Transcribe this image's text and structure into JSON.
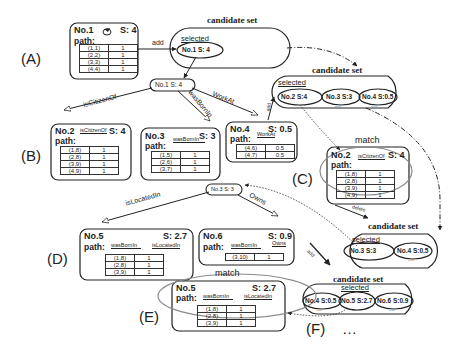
{
  "steps": {
    "A": "(A)",
    "B": "(B)",
    "C": "(C)",
    "D": "(D)",
    "E": "(E)",
    "F": "(F)",
    "ellipsis": "…"
  },
  "common": {
    "path": "path:",
    "candidate_set": "candidate set",
    "selected": "selected",
    "match": "match",
    "add": "add",
    "delete": "delete",
    "more": "..."
  },
  "nodes": {
    "n1": {
      "title": "No.1",
      "score": "S: 4",
      "rows": [
        [
          "(1,1)",
          "1"
        ],
        [
          "(2,2)",
          "1"
        ],
        [
          "(3,3)",
          "1"
        ],
        [
          "(4,4)",
          "1"
        ]
      ]
    },
    "n2": {
      "title": "No.2",
      "score": "S: 4",
      "relations": [
        "isCitizenOf"
      ],
      "rows": [
        [
          "(1,8)",
          "1"
        ],
        [
          "(2,8)",
          "1"
        ],
        [
          "(3,9)",
          "1"
        ],
        [
          "(4,9)",
          "1"
        ]
      ]
    },
    "n3": {
      "title": "No.3",
      "score": "S: 3",
      "relations": [
        "wasBornIn"
      ],
      "rows": [
        [
          "(1,5)",
          "1"
        ],
        [
          "(2,6)",
          "1"
        ],
        [
          "(3,7)",
          "1"
        ]
      ]
    },
    "n4": {
      "title": "No.4",
      "score": "S: 0.5",
      "relations": [
        "WorkAt"
      ],
      "rows": [
        [
          "(4,6)",
          "0.5"
        ],
        [
          "(4,7)",
          "0.5"
        ]
      ]
    },
    "n2c": {
      "title": "No.2",
      "score": "S: 4",
      "relations": [
        "isCitizenOf"
      ],
      "rows": [
        [
          "(1,8)",
          "1"
        ],
        [
          "(2,8)",
          "1"
        ],
        [
          "(3,9)",
          "1"
        ],
        [
          "(4,9)",
          "1"
        ]
      ]
    },
    "n5": {
      "title": "No.5",
      "score": "S: 2.7",
      "relations": [
        "wasBornIn",
        "isLocatedIn"
      ],
      "rows": [
        [
          "(1,8)",
          "1"
        ],
        [
          "(2,8)",
          "1"
        ],
        [
          "(3,9)",
          "1"
        ]
      ]
    },
    "n6": {
      "title": "No.6",
      "score": "S: 0.9",
      "relations": [
        "wasBornIn",
        "Owns"
      ],
      "rows": [
        [
          "(3,10)",
          "1"
        ]
      ]
    },
    "n5e": {
      "title": "No.5",
      "score": "S: 2.7",
      "relations": [
        "wasBornIn",
        "isLocatedIn"
      ],
      "rows": [
        [
          "(1,8)",
          "1"
        ],
        [
          "(2,8)",
          "1"
        ],
        [
          "(3,9)",
          "1"
        ]
      ]
    }
  },
  "expand_nodes": {
    "e1": {
      "label": "No.1  S: 4"
    },
    "e3": {
      "label": "No.3  S: 3"
    }
  },
  "edges": {
    "isCitizenOf": "isCitizenOf",
    "wasBornIn": "wasBornIn",
    "WorkAt": "WorkAt",
    "isLocatedIn": "isLocatedIn",
    "Owns": "Owns"
  },
  "candidate_sets": {
    "cs1": {
      "items": [
        "No.1  S: 4"
      ]
    },
    "cs2": {
      "items": [
        "No.2    S:4",
        "No.3  S:3",
        "No.4  S:0.5"
      ]
    },
    "cs3": {
      "items": [
        "No.3       S:3",
        "No.4  S:0.5"
      ]
    },
    "cs4": {
      "items": [
        "No.4 S:0.5",
        "No.5 S:2.7",
        "No.6 S:0.9"
      ]
    }
  },
  "colors": {
    "ink": "#222222",
    "match_ellipse": "#8a8a8a",
    "bg": "#ffffff"
  }
}
